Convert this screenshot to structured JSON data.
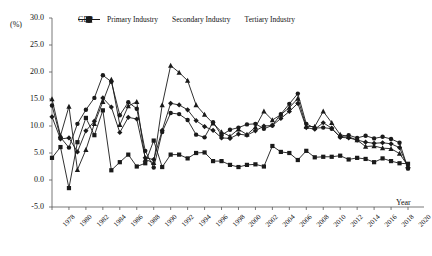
{
  "chart_data": {
    "type": "line",
    "title": "",
    "xlabel": "Year",
    "ylabel": "(%)",
    "ylim": [
      -5.0,
      30.0
    ],
    "xlim": [
      1978,
      2020
    ],
    "grid": false,
    "legend_position": "top",
    "ytick_labels": [
      "30.0",
      "25.0",
      "20.0",
      "15.0",
      "10.0",
      "5.0",
      "0.0",
      "-5.0"
    ],
    "ytick_values": [
      30.0,
      25.0,
      20.0,
      15.0,
      10.0,
      5.0,
      0.0,
      -5.0
    ],
    "xtick_labels": [
      "1978",
      "1980",
      "1982",
      "1984",
      "1986",
      "1988",
      "1990",
      "1992",
      "1994",
      "1996",
      "1998",
      "2000",
      "2002",
      "2004",
      "2006",
      "2008",
      "2010",
      "2012",
      "2014",
      "2016",
      "2018",
      "2020"
    ],
    "xtick_values": [
      1978,
      1980,
      1982,
      1984,
      1986,
      1988,
      1990,
      1992,
      1994,
      1996,
      1998,
      2000,
      2002,
      2004,
      2006,
      2008,
      2010,
      2012,
      2014,
      2016,
      2018,
      2020
    ],
    "x": [
      1978,
      1979,
      1980,
      1981,
      1982,
      1983,
      1984,
      1985,
      1986,
      1987,
      1988,
      1989,
      1990,
      1991,
      1992,
      1993,
      1994,
      1995,
      1996,
      1997,
      1998,
      1999,
      2000,
      2001,
      2002,
      2003,
      2004,
      2005,
      2006,
      2007,
      2008,
      2009,
      2010,
      2011,
      2012,
      2013,
      2014,
      2015,
      2016,
      2017,
      2018,
      2019,
      2020
    ],
    "series": [
      {
        "name": "GDP",
        "marker": "diamond",
        "color": "#1a1a1a",
        "values": [
          11.7,
          7.6,
          7.8,
          5.2,
          9.1,
          10.9,
          15.2,
          13.5,
          8.8,
          11.6,
          11.3,
          4.1,
          3.8,
          9.2,
          14.2,
          13.9,
          13.0,
          11.0,
          9.9,
          9.2,
          7.8,
          7.7,
          8.5,
          8.3,
          9.1,
          10.0,
          10.1,
          11.4,
          12.7,
          14.2,
          9.7,
          9.4,
          10.6,
          9.6,
          7.9,
          7.8,
          7.4,
          7.0,
          6.8,
          6.9,
          6.7,
          6.0,
          2.3
        ]
      },
      {
        "name": "Primary Industry",
        "marker": "square",
        "color": "#1a1a1a",
        "values": [
          4.1,
          6.1,
          -1.5,
          7.0,
          11.5,
          8.3,
          12.9,
          1.8,
          3.3,
          4.7,
          2.5,
          3.1,
          7.3,
          2.4,
          4.7,
          4.7,
          4.0,
          5.0,
          5.1,
          3.5,
          3.5,
          2.8,
          2.4,
          2.8,
          2.9,
          2.5,
          6.3,
          5.2,
          5.0,
          3.7,
          5.4,
          4.2,
          4.3,
          4.3,
          4.5,
          3.8,
          4.1,
          3.9,
          3.3,
          4.0,
          3.5,
          3.1,
          3.0
        ]
      },
      {
        "name": "Secondary Industry",
        "marker": "triangle",
        "color": "#1a1a1a",
        "values": [
          15.0,
          8.2,
          13.6,
          1.9,
          5.6,
          10.4,
          14.5,
          18.6,
          10.2,
          13.7,
          14.5,
          3.8,
          3.2,
          13.9,
          21.2,
          19.9,
          18.4,
          13.9,
          12.1,
          10.5,
          8.9,
          8.1,
          9.4,
          8.4,
          9.8,
          12.7,
          11.1,
          12.1,
          13.4,
          15.1,
          9.9,
          9.9,
          12.7,
          10.6,
          8.4,
          8.0,
          7.4,
          6.2,
          6.3,
          5.9,
          5.8,
          4.9,
          2.6
        ]
      },
      {
        "name": "Tertiary Industry",
        "marker": "circle",
        "color": "#1a1a1a",
        "values": [
          13.8,
          7.9,
          6.0,
          10.4,
          13.0,
          15.2,
          19.4,
          18.2,
          12.0,
          14.4,
          13.2,
          5.4,
          2.3,
          8.9,
          12.4,
          12.2,
          11.1,
          8.4,
          7.9,
          10.7,
          8.3,
          9.3,
          9.7,
          10.3,
          10.4,
          9.5,
          10.1,
          12.2,
          14.1,
          16.0,
          10.4,
          9.6,
          9.7,
          9.5,
          8.0,
          8.3,
          7.8,
          8.2,
          7.7,
          8.0,
          7.6,
          6.9,
          2.1
        ]
      }
    ]
  },
  "legend": {
    "items": [
      {
        "label": "GDP"
      },
      {
        "label": "Primary Industry"
      },
      {
        "label": "Secondary Industry"
      },
      {
        "label": "Tertiary Industry"
      }
    ]
  }
}
